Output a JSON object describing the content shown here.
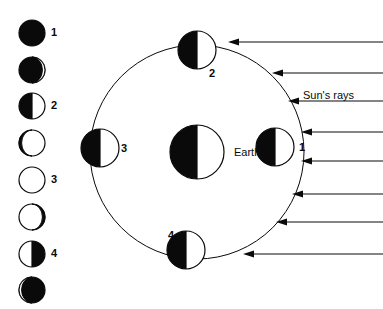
{
  "figure": {
    "background_color": "#ffffff",
    "ink_color": "#0a0a0a",
    "width": 383,
    "height": 309
  },
  "phase_column": {
    "caption": "",
    "disc_radius": 13,
    "center_x": 32,
    "discs": [
      {
        "id": "phase-disc-1",
        "center_y": 33,
        "appearance": "full-dark",
        "lit_fraction": 0.0,
        "label": "1",
        "label_x": 51,
        "label_y": 27
      },
      {
        "id": "phase-disc-2",
        "center_y": 70,
        "appearance": "dark-thin-light-right",
        "lit_fraction": 0.12,
        "label": "",
        "label_x": 0,
        "label_y": 0
      },
      {
        "id": "phase-disc-3",
        "center_y": 106,
        "appearance": "left-dark-right-light",
        "lit_fraction": 0.5,
        "label": "2",
        "label_x": 51,
        "label_y": 100
      },
      {
        "id": "phase-disc-4",
        "center_y": 143,
        "appearance": "light-thin-dark-left",
        "lit_fraction": 0.85,
        "label": "",
        "label_x": 0,
        "label_y": 0
      },
      {
        "id": "phase-disc-5",
        "center_y": 180,
        "appearance": "full-light",
        "lit_fraction": 1.0,
        "label": "3",
        "label_x": 51,
        "label_y": 174
      },
      {
        "id": "phase-disc-6",
        "center_y": 217,
        "appearance": "light-thin-dark-right",
        "lit_fraction": 0.85,
        "label": "",
        "label_x": 0,
        "label_y": 0
      },
      {
        "id": "phase-disc-7",
        "center_y": 254,
        "appearance": "left-light-right-dark",
        "lit_fraction": 0.5,
        "label": "4",
        "label_x": 51,
        "label_y": 248
      },
      {
        "id": "phase-disc-8",
        "center_y": 290,
        "appearance": "dark-thin-light-left",
        "lit_fraction": 0.12,
        "label": "",
        "label_x": 0,
        "label_y": 0
      }
    ]
  },
  "orbit_diagram": {
    "orbit": {
      "center_x": 197,
      "center_y": 152,
      "radius": 107,
      "stroke_width": 1
    },
    "earth": {
      "label": "Earth",
      "center_x": 197,
      "center_y": 152,
      "radius": 27,
      "appearance": "left-dark-right-light",
      "label_x": 234,
      "label_y": 147
    },
    "moons": [
      {
        "id": "moon-position-1",
        "label": "1",
        "center_x": 275,
        "center_y": 147,
        "radius": 19,
        "appearance": "left-dark-right-light",
        "label_x": 299,
        "label_y": 142
      },
      {
        "id": "moon-position-2",
        "label": "2",
        "center_x": 197,
        "center_y": 50,
        "radius": 19,
        "appearance": "left-dark-right-light",
        "label_x": 209,
        "label_y": 68
      },
      {
        "id": "moon-position-3",
        "label": "3",
        "center_x": 100,
        "center_y": 148,
        "radius": 19,
        "appearance": "left-dark-right-light",
        "label_x": 121,
        "label_y": 143
      },
      {
        "id": "moon-position-4",
        "label": "4",
        "center_x": 186,
        "center_y": 250,
        "radius": 19,
        "appearance": "left-dark-right-light",
        "label_x": 168,
        "label_y": 230
      }
    ],
    "sun_rays": {
      "label": "Sun's rays",
      "label_x": 303,
      "label_y": 90,
      "direction": "right-to-left",
      "arrows": [
        {
          "id": "sun-ray-1",
          "y": 42,
          "tip_x": 228,
          "tail_x": 383
        },
        {
          "id": "sun-ray-2",
          "y": 73,
          "tip_x": 272,
          "tail_x": 383
        },
        {
          "id": "sun-ray-3",
          "y": 101,
          "tip_x": 288,
          "tail_x": 383
        },
        {
          "id": "sun-ray-4",
          "y": 132,
          "tip_x": 301,
          "tail_x": 383
        },
        {
          "id": "sun-ray-5",
          "y": 161,
          "tip_x": 301,
          "tail_x": 383
        },
        {
          "id": "sun-ray-6",
          "y": 194,
          "tip_x": 292,
          "tail_x": 383
        },
        {
          "id": "sun-ray-7",
          "y": 222,
          "tip_x": 276,
          "tail_x": 383
        },
        {
          "id": "sun-ray-8",
          "y": 254,
          "tip_x": 243,
          "tail_x": 383
        }
      ]
    }
  }
}
